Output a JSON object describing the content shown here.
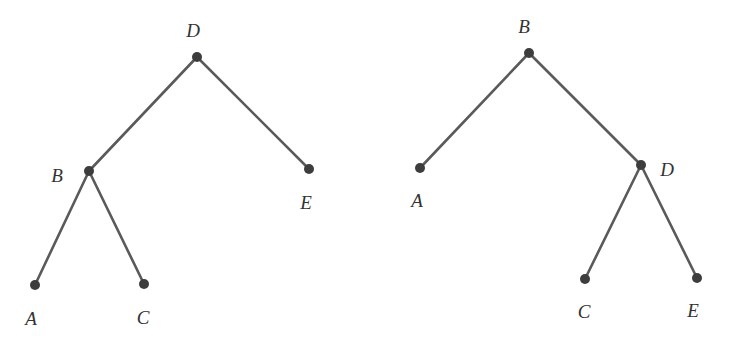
{
  "colors": {
    "edge": "#5a5a5a",
    "node": "#3d3d3d",
    "label": "#333333",
    "background": "#ffffff"
  },
  "trees": [
    {
      "root": "D",
      "nodes": [
        {
          "id": "D",
          "label": "D",
          "x": 197,
          "y": 57,
          "lx": 193,
          "ly": 37
        },
        {
          "id": "B",
          "label": "B",
          "x": 89,
          "y": 171,
          "lx": 57,
          "ly": 182
        },
        {
          "id": "E",
          "label": "E",
          "x": 309,
          "y": 169,
          "lx": 306,
          "ly": 209
        },
        {
          "id": "A",
          "label": "A",
          "x": 35,
          "y": 285,
          "lx": 31,
          "ly": 325
        },
        {
          "id": "C",
          "label": "C",
          "x": 144,
          "y": 284,
          "lx": 143,
          "ly": 324
        }
      ],
      "edges": [
        [
          "D",
          "B"
        ],
        [
          "D",
          "E"
        ],
        [
          "B",
          "A"
        ],
        [
          "B",
          "C"
        ]
      ]
    },
    {
      "root": "B",
      "nodes": [
        {
          "id": "B",
          "label": "B",
          "x": 529,
          "y": 53,
          "lx": 524,
          "ly": 33
        },
        {
          "id": "A",
          "label": "A",
          "x": 420,
          "y": 168,
          "lx": 417,
          "ly": 207
        },
        {
          "id": "D",
          "label": "D",
          "x": 641,
          "y": 165,
          "lx": 667,
          "ly": 176
        },
        {
          "id": "C",
          "label": "C",
          "x": 585,
          "y": 279,
          "lx": 584,
          "ly": 318
        },
        {
          "id": "E",
          "label": "E",
          "x": 697,
          "y": 278,
          "lx": 693,
          "ly": 317
        }
      ],
      "edges": [
        [
          "B",
          "A"
        ],
        [
          "B",
          "D"
        ],
        [
          "D",
          "C"
        ],
        [
          "D",
          "E"
        ]
      ]
    }
  ]
}
